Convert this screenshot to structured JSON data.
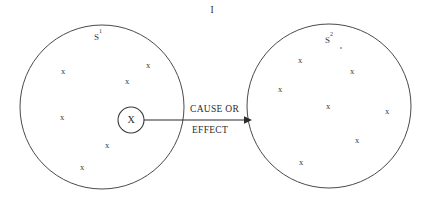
{
  "diagram": {
    "universe_label": "I",
    "relation": {
      "line1": "CAUSE OR",
      "line2": "EFFECT"
    },
    "focus_element": {
      "label": "X",
      "cx": 131,
      "cy": 120,
      "r": 13
    },
    "arrow": {
      "x1": 144,
      "y1": 120,
      "x2": 252,
      "y2": 120,
      "head_size": 6
    },
    "sets": [
      {
        "name": "left-set",
        "label_base": "S",
        "label_sup": "1",
        "label_x": 98,
        "label_y": 38,
        "cx": 102,
        "cy": 107,
        "r": 82,
        "members": [
          {
            "label": "x",
            "x": 63,
            "y": 72
          },
          {
            "label": "x",
            "x": 148,
            "y": 66
          },
          {
            "label": "x",
            "x": 127,
            "y": 82
          },
          {
            "label": "x",
            "x": 62,
            "y": 118
          },
          {
            "label": "x",
            "x": 107,
            "y": 146
          },
          {
            "label": "x",
            "x": 82,
            "y": 168
          }
        ]
      },
      {
        "name": "right-set",
        "label_base": "S",
        "label_sup": "2",
        "label_x": 329,
        "label_y": 41,
        "cx": 329,
        "cy": 106,
        "r": 82,
        "members": [
          {
            "label": "x",
            "x": 300,
            "y": 61
          },
          {
            "label": "x",
            "x": 352,
            "y": 72
          },
          {
            "label": "x",
            "x": 280,
            "y": 90
          },
          {
            "label": "x",
            "x": 328,
            "y": 107
          },
          {
            "label": "x",
            "x": 387,
            "y": 112
          },
          {
            "label": "x",
            "x": 357,
            "y": 141
          },
          {
            "label": "x",
            "x": 301,
            "y": 163
          }
        ]
      }
    ],
    "accent_dot": {
      "x": 341,
      "y": 48,
      "r": 0.9
    },
    "colors": {
      "background": "#ffffff",
      "stroke": "#4a4a4a",
      "text": "#2b2b2b",
      "mark": "#3a3a3a"
    }
  }
}
